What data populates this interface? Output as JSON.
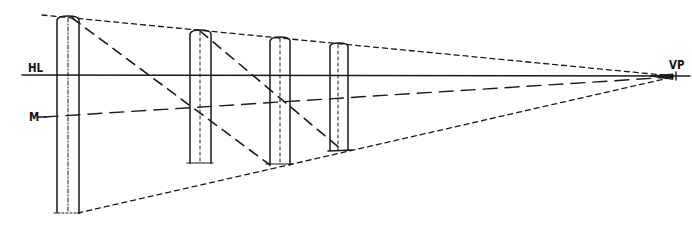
{
  "diagram": {
    "type": "one-point perspective construction",
    "labels": {
      "horizon_line": "HL",
      "measuring_line": "M",
      "vanishing_point": "VP"
    },
    "vanishing_point": {
      "x": 673,
      "y": 76
    },
    "horizon_y": 75,
    "posts": [
      {
        "id": 1,
        "left": 57,
        "right": 79,
        "top": 17,
        "bottom": 213
      },
      {
        "id": 2,
        "left": 190,
        "right": 211,
        "top": 30,
        "bottom": 163
      },
      {
        "id": 3,
        "left": 270,
        "right": 290,
        "top": 38,
        "bottom": 148
      },
      {
        "id": 4,
        "left": 330,
        "right": 348,
        "top": 43,
        "bottom": 151
      }
    ],
    "line_color": "#1a1a1a",
    "background": "#ffffff"
  }
}
